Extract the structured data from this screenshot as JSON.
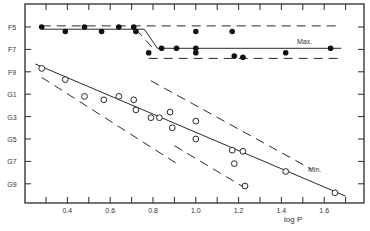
{
  "chart_data": {
    "type": "scatter",
    "title": "",
    "xlabel": "log P",
    "ylabel": "",
    "xlim": [
      0.22,
      1.78
    ],
    "x_ticks": [
      0.3,
      0.4,
      0.5,
      0.6,
      0.7,
      0.8,
      0.9,
      1.0,
      1.1,
      1.2,
      1.3,
      1.4,
      1.5,
      1.6,
      1.7
    ],
    "x_tick_labels": [
      "0.4",
      "0.6",
      "0.8",
      "1.0",
      "1.2",
      "1.4",
      "1.6"
    ],
    "y_tick_labels": [
      "F5",
      "F7",
      "F9",
      "G1",
      "G3",
      "G5",
      "G7",
      "G9"
    ],
    "y_axis_note": "spectral type; value = subclass index where F5=0, F6=1 ... G9=14",
    "grid": false,
    "annotations": [
      "Max.",
      "Min."
    ],
    "series": [
      {
        "name": "Max.",
        "marker": "filled-circle",
        "points": [
          [
            0.28,
            0.0
          ],
          [
            0.39,
            0.4
          ],
          [
            0.48,
            0.0
          ],
          [
            0.56,
            0.4
          ],
          [
            0.64,
            0.0
          ],
          [
            0.71,
            0.0
          ],
          [
            0.72,
            0.4
          ],
          [
            0.78,
            2.3
          ],
          [
            0.84,
            1.9
          ],
          [
            0.91,
            1.9
          ],
          [
            1.0,
            1.9
          ],
          [
            1.0,
            2.3
          ],
          [
            1.0,
            0.4
          ],
          [
            1.17,
            0.4
          ],
          [
            1.18,
            2.6
          ],
          [
            1.22,
            2.7
          ],
          [
            1.42,
            2.3
          ],
          [
            1.63,
            1.9
          ]
        ]
      },
      {
        "name": "Min.",
        "marker": "open-circle",
        "points": [
          [
            0.28,
            3.7
          ],
          [
            0.39,
            4.7
          ],
          [
            0.48,
            6.2
          ],
          [
            0.57,
            6.5
          ],
          [
            0.64,
            6.2
          ],
          [
            0.71,
            6.5
          ],
          [
            0.72,
            7.4
          ],
          [
            0.79,
            8.1
          ],
          [
            0.83,
            8.1
          ],
          [
            0.88,
            7.6
          ],
          [
            0.89,
            9.0
          ],
          [
            1.0,
            8.4
          ],
          [
            1.0,
            10.0
          ],
          [
            1.17,
            11.0
          ],
          [
            1.18,
            12.2
          ],
          [
            1.22,
            11.1
          ],
          [
            1.23,
            14.2
          ],
          [
            1.42,
            12.9
          ],
          [
            1.65,
            14.8
          ]
        ]
      }
    ],
    "lines": [
      {
        "name": "max-fit",
        "style": "solid",
        "points": [
          [
            0.28,
            0.2
          ],
          [
            0.76,
            0.2
          ],
          [
            0.82,
            1.9
          ],
          [
            1.68,
            1.9
          ]
        ]
      },
      {
        "name": "max-upper-bound",
        "style": "dashed",
        "points": [
          [
            0.28,
            -0.1
          ],
          [
            1.68,
            -0.1
          ]
        ]
      },
      {
        "name": "max-lower-bound",
        "style": "dashed",
        "points": [
          [
            0.78,
            2.8
          ],
          [
            1.68,
            2.8
          ]
        ]
      },
      {
        "name": "max-step-dash",
        "style": "dashed",
        "points": [
          [
            0.72,
            0.2
          ],
          [
            0.8,
            1.9
          ]
        ]
      },
      {
        "name": "min-fit",
        "style": "solid",
        "points": [
          [
            0.25,
            3.3
          ],
          [
            1.7,
            15.1
          ]
        ]
      },
      {
        "name": "min-upper-dash",
        "style": "dashed",
        "points": [
          [
            0.79,
            4.8
          ],
          [
            1.54,
            12.7
          ]
        ]
      },
      {
        "name": "min-lower-dash-1",
        "style": "dashed",
        "points": [
          [
            0.28,
            4.5
          ],
          [
            0.92,
            12.3
          ]
        ]
      },
      {
        "name": "min-lower-dash-2",
        "style": "dashed",
        "points": [
          [
            0.9,
            10.6
          ],
          [
            1.25,
            14.6
          ]
        ]
      }
    ]
  },
  "labels": {
    "xlabel": "log P",
    "max": "Max.",
    "min": "Min."
  }
}
